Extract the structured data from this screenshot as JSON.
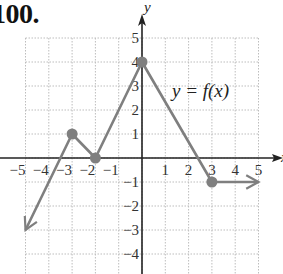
{
  "problem_number": "100.",
  "chart_data": {
    "type": "line",
    "title": "",
    "function_label": "y = f(x)",
    "xlabel": "x",
    "ylabel": "y",
    "xlim": [
      -5,
      5
    ],
    "ylim": [
      -5,
      5
    ],
    "grid": true,
    "x_ticks": [
      "-5",
      "-4",
      "-3",
      "-2",
      "-1",
      "1",
      "2",
      "3",
      "4",
      "5"
    ],
    "y_ticks": [
      "5",
      "4",
      "3",
      "2",
      "1",
      "-1",
      "-2",
      "-3",
      "-4"
    ],
    "series": [
      {
        "name": "f(x)",
        "points": [
          [
            -5,
            -3
          ],
          [
            -3,
            1
          ],
          [
            -2,
            0
          ],
          [
            0,
            4
          ],
          [
            3,
            -1
          ],
          [
            5,
            -1
          ]
        ],
        "marked_points": [
          [
            -3,
            1
          ],
          [
            -2,
            0
          ],
          [
            0,
            4
          ],
          [
            3,
            -1
          ]
        ],
        "arrow_ends": [
          [
            -5,
            -3
          ],
          [
            5,
            -1
          ]
        ]
      }
    ],
    "colors": {
      "curve": "#7f7f7f",
      "axis": "#222222",
      "grid": "#bdbdbd"
    }
  }
}
